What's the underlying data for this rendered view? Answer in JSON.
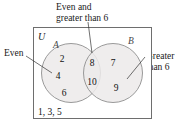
{
  "diagram": {
    "type": "venn-two-set",
    "universe_label": "U",
    "outside_elements": "1, 3, 5",
    "sets": {
      "left": {
        "letter": "A",
        "callout": "Even",
        "elements": [
          "2",
          "4",
          "6"
        ]
      },
      "right": {
        "letter": "B",
        "callout_line1": "Greater",
        "callout_line2": "than 6",
        "elements": [
          "7",
          "9"
        ]
      },
      "intersection": {
        "callout_line1": "Even and",
        "callout_line2": "greater than 6",
        "elements": [
          "8",
          "10"
        ]
      }
    },
    "colors": {
      "circle_fill": "#eceaea",
      "circle_stroke": "#8e8e8e",
      "rect_stroke": "#6e6e6e",
      "text": "#111111",
      "leader": "#333333"
    }
  }
}
